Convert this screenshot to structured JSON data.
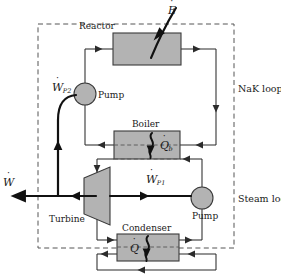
{
  "figure": {
    "width": 281,
    "height": 275,
    "background": "#ffffff"
  },
  "colors": {
    "line": "#2b2b2b",
    "shaft": "#111111",
    "box_fill": "#b3b3b3",
    "box_stroke": "#3a3a3a",
    "pump_fill": "#b3b3b3",
    "pump_stroke": "#3a3a3a",
    "boundary_dash": "#555555",
    "text": "#1a1a1a"
  },
  "boundary": {
    "name": "system-boundary",
    "style": "dashed",
    "x": 38,
    "y": 24,
    "width": 196,
    "height": 224
  },
  "components": [
    {
      "id": "reactor",
      "label": "Reactor",
      "x": 113,
      "y": 33,
      "width": 68,
      "height": 32,
      "label_x": 79,
      "label_y": 22
    },
    {
      "id": "boiler",
      "label": "Boiler",
      "x": 114,
      "y": 131,
      "width": 66,
      "height": 28,
      "label_x": 132,
      "label_y": 120
    },
    {
      "id": "condenser",
      "label": "Condenser",
      "x": 117,
      "y": 234,
      "width": 62,
      "height": 27,
      "label_x": 122,
      "label_y": 224
    },
    {
      "id": "turbine",
      "label": "Turbine",
      "x": 84,
      "y": 173,
      "width": 26,
      "height": 46,
      "label_x": 49,
      "label_y": 215
    }
  ],
  "pumps": [
    {
      "id": "pump-nak",
      "label": "Pump",
      "cx": 85,
      "cy": 94,
      "r": 11,
      "label_x": 98,
      "label_y": 91
    },
    {
      "id": "pump-steam",
      "label": "Pump",
      "cx": 202,
      "cy": 198,
      "r": 11,
      "label_x": 192,
      "label_y": 212
    }
  ],
  "loops": [
    {
      "id": "nak-loop",
      "label": "NaK loop",
      "x": 238,
      "y": 84
    },
    {
      "id": "steam-loop",
      "label": "Steam loop",
      "x": 238,
      "y": 194
    }
  ],
  "energy_symbols": [
    {
      "id": "e-dot",
      "base": "E",
      "sub": "",
      "x": 168,
      "y": 5,
      "desc": "reactor thermal energy input"
    },
    {
      "id": "wp2-dot",
      "base": "W",
      "sub": "P2",
      "x": 52,
      "y": 82,
      "desc": "NaK pump work input"
    },
    {
      "id": "wp1-dot",
      "base": "W",
      "sub": "P1",
      "x": 146,
      "y": 174,
      "desc": "feedwater pump work input"
    },
    {
      "id": "w-dot",
      "base": "W",
      "sub": "",
      "x": 3,
      "y": 177,
      "desc": "net turbine work output"
    },
    {
      "id": "qb-dot",
      "base": "Q",
      "sub": "b",
      "x": 152,
      "y": 140,
      "desc": "boiler heat transfer"
    },
    {
      "id": "q-dot",
      "base": "Q",
      "sub": "",
      "x": 130,
      "y": 243,
      "desc": "condenser heat rejection"
    }
  ],
  "flow_paths": {
    "nak": [
      "reactor-outlet-right",
      "nak-down-right",
      "boiler-inlet-right",
      "boiler-outlet-left",
      "nak-up-left",
      "pump-nak",
      "reactor-inlet-left"
    ],
    "steam": [
      "boiler-steam-outlet-left",
      "turbine-inlet",
      "turbine-exhaust",
      "condenser-inlet-left",
      "condenser-outlet-right",
      "pump-steam",
      "boiler-feed-right"
    ],
    "cooling_water": [
      "coolant-inlet-right",
      "condenser-pass",
      "coolant-outlet-left"
    ],
    "shafts": [
      "turbine-output-shaft-left",
      "pump-steam-shaft",
      "pump-nak-shaft-curved"
    ]
  }
}
